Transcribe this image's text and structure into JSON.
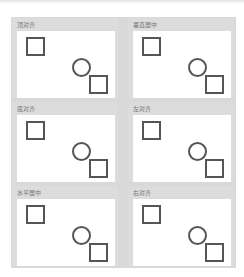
{
  "panels": [
    {
      "label": "顶对齐"
    },
    {
      "label": "垂直居中"
    },
    {
      "label": "底对齐"
    },
    {
      "label": "左对齐"
    },
    {
      "label": "水平居中"
    },
    {
      "label": "右对齐"
    }
  ],
  "colors": {
    "panel_bg": "#dcdcdc",
    "shape_stroke": "#555555",
    "canvas": "#ffffff"
  }
}
